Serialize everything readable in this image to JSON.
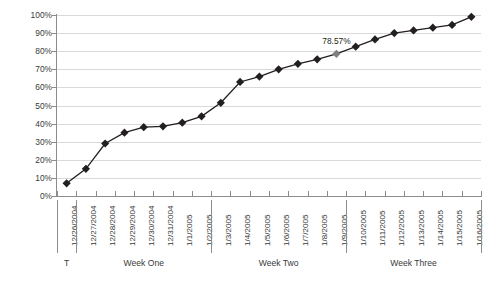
{
  "chart_data": {
    "type": "line",
    "title": "",
    "xlabel": "",
    "ylabel": "Cumulative percentage",
    "ylim": [
      0,
      100
    ],
    "grid": true,
    "legend": "none",
    "y_ticks": [
      "0%",
      "10%",
      "20%",
      "30%",
      "40%",
      "50%",
      "60%",
      "70%",
      "80%",
      "90%",
      "100%"
    ],
    "y_tick_values": [
      0,
      10,
      20,
      30,
      40,
      50,
      60,
      70,
      80,
      90,
      100
    ],
    "categories": [
      "12/26/2004",
      "12/27/2004",
      "12/28/2004",
      "12/29/2004",
      "12/30/2004",
      "12/31/2004",
      "1/1/2005",
      "1/2/2005",
      "1/3/2005",
      "1/4/2005",
      "1/5/2005",
      "1/6/2005",
      "1/7/2005",
      "1/8/2005",
      "1/9/2005",
      "1/10/2005",
      "1/11/2005",
      "1/12/2005",
      "1/13/2005",
      "1/14/2005",
      "1/15/2005",
      "1/16/2005"
    ],
    "values": [
      7,
      15,
      29,
      35,
      38,
      38.5,
      40.5,
      44,
      51.5,
      63,
      66,
      70,
      73,
      75.5,
      78.57,
      82.5,
      86.5,
      90,
      91.5,
      93,
      94.5,
      99
    ],
    "series": [
      {
        "name": "Cumulative percentage",
        "values": [
          7,
          15,
          29,
          35,
          38,
          38.5,
          40.5,
          44,
          51.5,
          63,
          66,
          70,
          73,
          75.5,
          78.57,
          82.5,
          86.5,
          90,
          91.5,
          93,
          94.5,
          99
        ]
      }
    ],
    "highlight": {
      "index": 14,
      "category": "1/8/2005",
      "value": 78.57,
      "label": "78.57%",
      "marker_color": "#808080"
    },
    "marker": "diamond",
    "line_color": "#231f20",
    "marker_color": "#231f20",
    "grid_color": "#d9d9d9",
    "axis_color": "#8c8c8c",
    "group_labels": [
      {
        "label": "T",
        "start_index": 0,
        "end_index": 0
      },
      {
        "label": "Week One",
        "start_index": 1,
        "end_index": 7
      },
      {
        "label": "Week Two",
        "start_index": 8,
        "end_index": 14
      },
      {
        "label": "Week Three",
        "start_index": 15,
        "end_index": 21
      }
    ]
  }
}
